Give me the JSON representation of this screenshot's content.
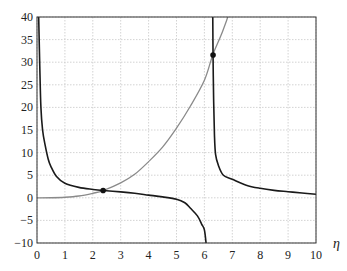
{
  "chart_data": {
    "type": "line",
    "title": "",
    "xlabel": "η",
    "ylabel": "",
    "xlim": [
      0,
      10
    ],
    "ylim": [
      -10,
      40
    ],
    "xticks": [
      0,
      1,
      2,
      3,
      4,
      5,
      6,
      7,
      8,
      9,
      10
    ],
    "yticks": [
      -10,
      -5,
      0,
      5,
      10,
      15,
      20,
      25,
      30,
      35,
      40
    ],
    "xtick_labels": [
      "0",
      "1",
      "2",
      "3",
      "4",
      "5",
      "6",
      "7",
      "8",
      "9",
      "10"
    ],
    "ytick_labels": [
      "−10",
      "−5",
      "0",
      "5",
      "10",
      "15",
      "20",
      "25",
      "30",
      "35",
      "40"
    ],
    "grid": true,
    "legend": null,
    "series": [
      {
        "name": "gray-curve",
        "color": "#8a8a8a",
        "branches": [
          [
            [
              0,
              0
            ],
            [
              0.5,
              0.015
            ],
            [
              1,
              0.12
            ],
            [
              1.5,
              0.4
            ],
            [
              2,
              1.0
            ],
            [
              2.37,
              1.6
            ],
            [
              3,
              3.3
            ],
            [
              3.5,
              5.2
            ],
            [
              4,
              8.0
            ],
            [
              4.5,
              11.2
            ],
            [
              5,
              15.4
            ],
            [
              5.5,
              20.3
            ],
            [
              6,
              26.0
            ],
            [
              6.3,
              31.6
            ],
            [
              6.6,
              36.0
            ],
            [
              6.84,
              40
            ]
          ]
        ]
      },
      {
        "name": "black-curve",
        "color": "#1a1a1a",
        "branches": [
          [
            [
              0.06,
              40
            ],
            [
              0.1,
              29
            ],
            [
              0.14,
              20
            ],
            [
              0.2,
              15
            ],
            [
              0.29,
              11.7
            ],
            [
              0.4,
              8.6
            ],
            [
              0.5,
              6.9
            ],
            [
              0.7,
              4.7
            ],
            [
              1,
              3.2
            ],
            [
              1.5,
              2.3
            ],
            [
              2,
              1.85
            ],
            [
              2.37,
              1.6
            ],
            [
              3,
              1.3
            ],
            [
              3.5,
              1.0
            ],
            [
              4,
              0.6
            ],
            [
              4.5,
              0.2
            ],
            [
              5,
              -0.3
            ],
            [
              5.3,
              -1.1
            ],
            [
              5.5,
              -2.3
            ],
            [
              5.75,
              -4.0
            ],
            [
              5.9,
              -5.8
            ],
            [
              6,
              -7.1
            ],
            [
              6.06,
              -10
            ]
          ],
          [
            [
              6.3,
              40
            ],
            [
              6.31,
              31.6
            ],
            [
              6.33,
              22
            ],
            [
              6.36,
              14
            ],
            [
              6.4,
              9.6
            ],
            [
              6.5,
              7.2
            ],
            [
              6.68,
              5.0
            ],
            [
              7,
              4.1
            ],
            [
              7.5,
              2.8
            ],
            [
              8,
              2.1
            ],
            [
              8.5,
              1.65
            ],
            [
              9,
              1.35
            ],
            [
              9.5,
              1.05
            ],
            [
              10,
              0.8
            ]
          ]
        ]
      }
    ],
    "markers": [
      {
        "x": 2.37,
        "y": 1.6,
        "label": "lower intersection"
      },
      {
        "x": 6.31,
        "y": 31.6,
        "label": "upper intersection"
      }
    ]
  }
}
